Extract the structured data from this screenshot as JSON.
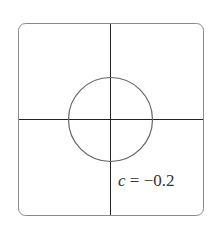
{
  "diagram": {
    "type": "level-curve",
    "frame": {
      "x": 18,
      "y": 23,
      "width": 186,
      "height": 193,
      "corner_radius": 7,
      "stroke": "#8a8a8a"
    },
    "axes": {
      "origin": {
        "x": 110,
        "y": 119
      },
      "stroke": "#222222"
    },
    "circle": {
      "cx": 110,
      "cy": 119,
      "r": 42,
      "stroke": "#666666"
    },
    "label": {
      "variable": "c",
      "equals": " = ",
      "value": "−0.2"
    }
  }
}
